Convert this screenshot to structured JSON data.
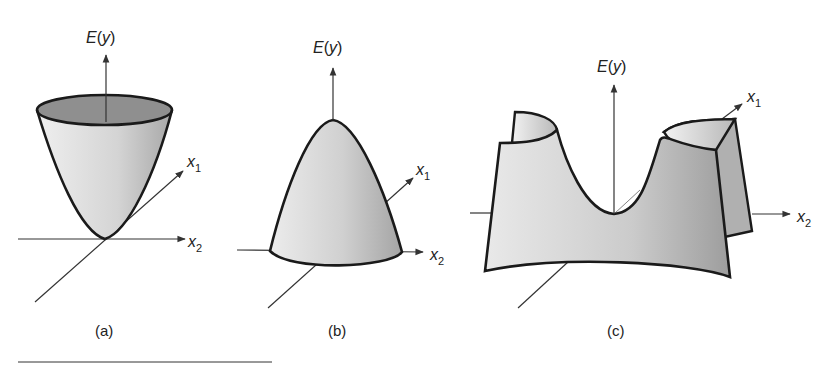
{
  "figure": {
    "panels": [
      {
        "id": "a",
        "caption": "(a)",
        "surface": "paraboloid opening upward (minimum)",
        "axis_labels": {
          "vertical": "E(y)",
          "x1": "x",
          "x1_sub": "1",
          "x2": "x",
          "x2_sub": "2"
        }
      },
      {
        "id": "b",
        "caption": "(b)",
        "surface": "paraboloid opening downward (maximum)",
        "axis_labels": {
          "vertical": "E(y)",
          "x1": "x",
          "x1_sub": "1",
          "x2": "x",
          "x2_sub": "2"
        }
      },
      {
        "id": "c",
        "caption": "(c)",
        "surface": "saddle surface",
        "axis_labels": {
          "vertical": "E(y)",
          "x1": "x",
          "x1_sub": "1",
          "x2": "x",
          "x2_sub": "2"
        }
      }
    ],
    "colors": {
      "outline": "#1a1a1a",
      "axis": "#333333",
      "fill_light": "#e6e6e6",
      "fill_mid": "#c8c8c8",
      "fill_dark": "#9a9a9a",
      "text": "#222222"
    }
  }
}
